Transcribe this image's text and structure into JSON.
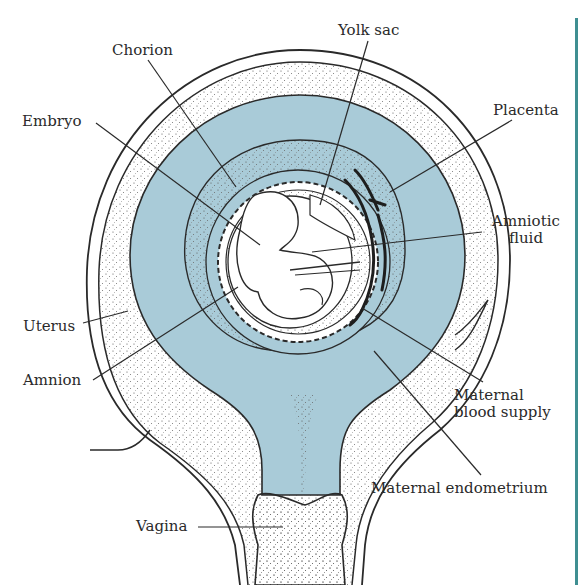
{
  "diagram": {
    "title": "",
    "colors": {
      "fluid": "#a9cbd8",
      "ink": "#2a2a2a",
      "stipple": "#555555",
      "accent_rule": "#3f8f92",
      "background": "#ffffff"
    },
    "labels": {
      "chorion": "Chorion",
      "yolk_sac": "Yolk sac",
      "embryo": "Embryo",
      "placenta": "Placenta",
      "amniotic_fluid_1": "Amniotic",
      "amniotic_fluid_2": "fluid",
      "uterus": "Uterus",
      "amnion": "Amnion",
      "maternal_blood_1": "Maternal",
      "maternal_blood_2": "blood supply",
      "maternal_endometrium": "Maternal endometrium",
      "vagina": "Vagina"
    }
  }
}
